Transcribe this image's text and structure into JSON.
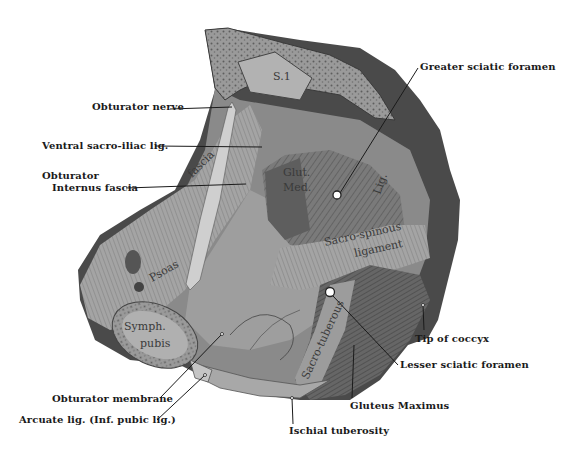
{
  "figure": {
    "type": "anatomical-illustration",
    "external_labels": [
      {
        "id": "obturator-nerve",
        "text": "Obturator nerve",
        "x": 92,
        "y": 101
      },
      {
        "id": "ventral-sacro-iliac-lig",
        "text": "Ventral sacro-iliac lig.",
        "x": 42,
        "y": 140
      },
      {
        "id": "obturator-internus-fascia-1",
        "text": "Obturator",
        "x": 42,
        "y": 172
      },
      {
        "id": "obturator-internus-fascia-2",
        "text": "Internus fascia",
        "x": 52,
        "y": 184
      },
      {
        "id": "greater-sciatic-foramen",
        "text": "Greater sciatic foramen",
        "x": 420,
        "y": 61
      },
      {
        "id": "tip-of-coccyx",
        "text": "Tip of coccyx",
        "x": 415,
        "y": 337
      },
      {
        "id": "lesser-sciatic-foramen",
        "text": "Lesser sciatic foramen",
        "x": 400,
        "y": 361
      },
      {
        "id": "gluteus-maximus",
        "text": "Gluteus Maximus",
        "x": 350,
        "y": 402
      },
      {
        "id": "obturator-membrane",
        "text": "Obturator membrane",
        "x": 52,
        "y": 395
      },
      {
        "id": "arcuate-lig",
        "text": "Arcuate lig. (Inf. pubic lig.)",
        "x": 19,
        "y": 417
      },
      {
        "id": "ischial-tuberosity",
        "text": "Ischial tuberosity",
        "x": 289,
        "y": 427
      }
    ],
    "internal_labels": {
      "s1": "S.1",
      "psoas": "Psoas",
      "fascia": "fascia",
      "glut": "Glut.",
      "med": "Med.",
      "lig": "Lig.",
      "sacro_spinous": "Sacro-spinous",
      "ligament": "ligament",
      "sacro_tuberous": "Sacro-tuberous",
      "symph": "Symph.",
      "pubis": "pubis"
    },
    "colors": {
      "ink": "#1a1a1a",
      "bone": "#8c8c8c",
      "muscle": "#6e6e6e",
      "fascia": "#b5b5b5",
      "shadow": "#3c3c3c",
      "paper": "#ffffff"
    }
  }
}
